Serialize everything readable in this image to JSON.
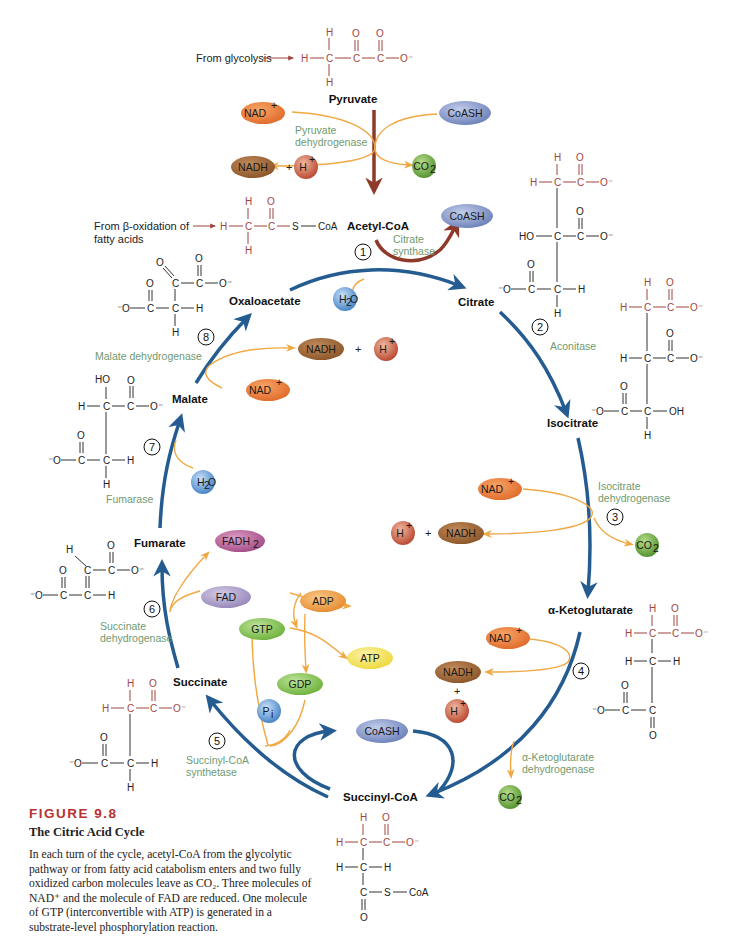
{
  "figure": {
    "number": "FIGURE 9.8",
    "title": "The Citric Acid Cycle",
    "caption": "In each turn of the cycle, acetyl-CoA from the glycolytic pathway or from fatty acid catabolism enters and two fully oxidized carbon molecules leave as CO₂. Three molecules of NAD⁺ and the molecule of FAD are reduced. One molecule of GTP (interconvertible with ATP) is generated in a substrate-level phosphorylation reaction."
  },
  "sources": {
    "glycolysis": "From glycolysis",
    "beta_oxidation_line1": "From β-oxidation of",
    "beta_oxidation_line2": "fatty acids"
  },
  "intermediates": {
    "pyruvate": "Pyruvate",
    "acetyl_coa": "Acetyl-CoA",
    "citrate": "Citrate",
    "isocitrate": "Isocitrate",
    "alpha_ketoglutarate": "α-Ketoglutarate",
    "succinyl_coa": "Succinyl-CoA",
    "succinate": "Succinate",
    "fumarate": "Fumarate",
    "malate": "Malate",
    "oxaloacetate": "Oxaloacetate"
  },
  "enzymes": {
    "pdh_1": "Pyruvate",
    "pdh_2": "dehydrogenase",
    "e1_1": "Citrate",
    "e1_2": "synthase",
    "e2": "Aconitase",
    "e3_1": "Isocitrate",
    "e3_2": "dehydrogenase",
    "e4_1": "α-Ketoglutarate",
    "e4_2": "dehydrogenase",
    "e5_1": "Succinyl-CoA",
    "e5_2": "synthetase",
    "e6_1": "Succinate",
    "e6_2": "dehydrogenase",
    "e7": "Fumarase",
    "e8": "Malate dehydrogenase"
  },
  "steps": [
    "1",
    "2",
    "3",
    "4",
    "5",
    "6",
    "7",
    "8"
  ],
  "cofactors": {
    "nad_plus": "NAD",
    "plus_sup": "+",
    "nadh": "NADH",
    "h_plus": "H",
    "co2": "CO",
    "sub2": "2",
    "coash": "CoASH",
    "h2o_h": "H",
    "h2o_o": "O",
    "fad": "FAD",
    "fadh2": "FADH",
    "gtp": "GTP",
    "gdp": "GDP",
    "adp": "ADP",
    "atp": "ATP",
    "pi": "P",
    "pi_sub": "i",
    "plus_sign": "+"
  },
  "colors": {
    "cycle_arrow": "#245c91",
    "side_arrow": "#f0a843",
    "entry_arrow": "#8e3a2a",
    "enzyme_text": "#6f9a6f",
    "red_atoms": "#a0453f",
    "figure_number": "#b8322f",
    "nad_plus": "#e97a32",
    "nadh": "#9a6434",
    "h_plus": "#c45a3e",
    "co2": "#6aa640",
    "coash": "#7c8fc4",
    "h2o": "#4f8fcf",
    "fad": "#a295c0",
    "fadh2": "#b25a92",
    "gtp": "#7fbf4a",
    "adp": "#eb9a3d",
    "atp": "#f0df4a"
  },
  "atoms": {
    "H": "H",
    "C": "C",
    "O": "O",
    "Ominus": "O⁻",
    "minusO": "⁻O",
    "HO": "HO",
    "OH": "OH",
    "S": "S",
    "CoA": "CoA"
  }
}
